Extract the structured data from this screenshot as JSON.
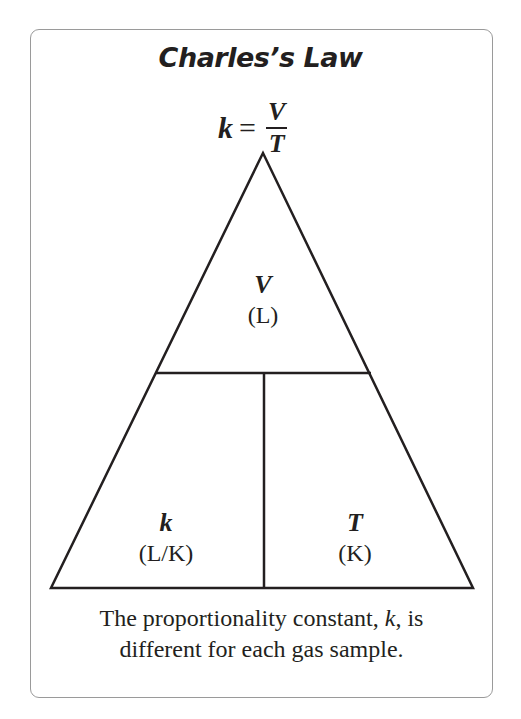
{
  "title": "Charles’s Law",
  "formula": {
    "lhs": "k",
    "equals": "=",
    "numerator": "V",
    "denominator": "T"
  },
  "triangle": {
    "top": {
      "symbol": "V",
      "unit": "(L)"
    },
    "bottom_left": {
      "symbol": "k",
      "unit": "(L/K)"
    },
    "bottom_right": {
      "symbol": "T",
      "unit": "(K)"
    }
  },
  "caption": {
    "line1_before": "The proportionality constant, ",
    "line1_var": "k",
    "line1_after": ", is",
    "line2": "different for each gas sample."
  },
  "colors": {
    "ink": "#231f20",
    "border": "#9a9a9a",
    "background": "#ffffff"
  }
}
